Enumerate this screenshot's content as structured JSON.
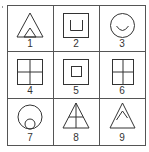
{
  "puzzle": {
    "stray_mark": {
      "x": 2,
      "y": 6
    },
    "grid": {
      "x": 7,
      "y": 5,
      "width": 138,
      "height": 140,
      "col_dividers": [
        53,
        99
      ],
      "row_dividers": [
        51,
        98
      ],
      "line_color": "#555555",
      "shape_color": "#333333"
    },
    "cells": [
      {
        "label": "1",
        "figure": "triangle-with-small-inner-triangle-at-base"
      },
      {
        "label": "2",
        "figure": "square-with-inner-u-shape"
      },
      {
        "label": "3",
        "figure": "circle-with-inner-smile-arc"
      },
      {
        "label": "4",
        "figure": "square-divided-into-four"
      },
      {
        "label": "5",
        "figure": "square-with-small-inner-square"
      },
      {
        "label": "6",
        "figure": "tall-rectangle-divided-into-four"
      },
      {
        "label": "7",
        "figure": "circle-with-small-inner-circle-at-bottom"
      },
      {
        "label": "8",
        "figure": "triangle-with-vertical-and-horizontal-lines"
      },
      {
        "label": "9",
        "figure": "triangle-with-inner-caret"
      }
    ]
  }
}
